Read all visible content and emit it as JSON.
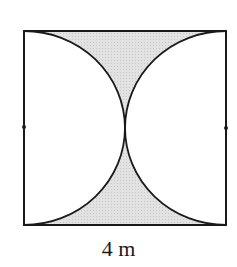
{
  "diagram": {
    "shape": "square",
    "side_label": "4 m",
    "colors": {
      "stroke": "#1a1a1a",
      "shade": "#dcdcdc",
      "background": "#ffffff"
    }
  }
}
